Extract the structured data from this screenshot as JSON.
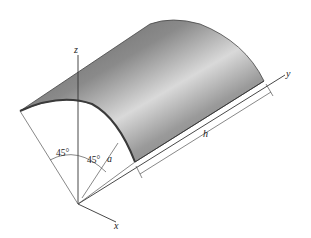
{
  "figure": {
    "axes": {
      "x_label": "x",
      "y_label": "y",
      "z_label": "z"
    },
    "dimensions": {
      "radius_label": "a",
      "length_label": "h",
      "angle_left_label": "45°",
      "angle_right_label": "45°"
    },
    "colors": {
      "shell_dark": "#6e6e6e",
      "shell_light": "#d8d8d8",
      "line": "#333333"
    }
  }
}
